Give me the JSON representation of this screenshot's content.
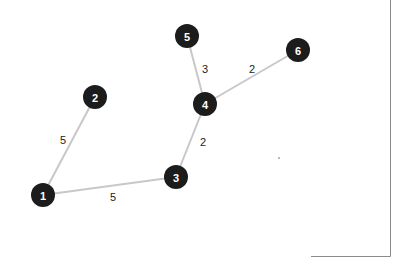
{
  "graph": {
    "type": "weighted-undirected-graph",
    "colors": {
      "node_fill": "#1c1c1c",
      "node_text": "#ffffff",
      "edge_stroke": "#c8c8c8",
      "edge_label_text": "#222222",
      "frame": "#8a8a8a"
    },
    "nodes": [
      {
        "id": "1",
        "label": "1"
      },
      {
        "id": "2",
        "label": "2"
      },
      {
        "id": "3",
        "label": "3"
      },
      {
        "id": "4",
        "label": "4"
      },
      {
        "id": "5",
        "label": "5"
      },
      {
        "id": "6",
        "label": "6"
      }
    ],
    "edges": [
      {
        "source": "1",
        "target": "2",
        "weight": "5"
      },
      {
        "source": "1",
        "target": "3",
        "weight": "5"
      },
      {
        "source": "3",
        "target": "4",
        "weight": "2"
      },
      {
        "source": "4",
        "target": "5",
        "weight": "3"
      },
      {
        "source": "4",
        "target": "6",
        "weight": "2"
      }
    ]
  }
}
